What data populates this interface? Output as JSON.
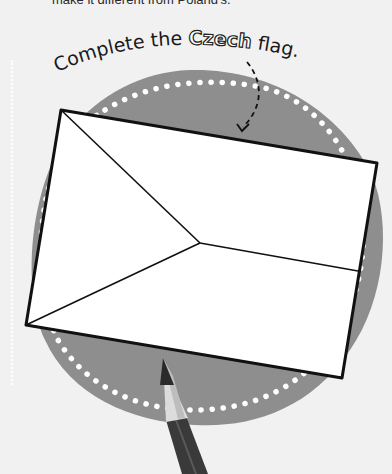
{
  "page": {
    "top_text": "make it different from Poland's.",
    "title_prefix": "Complete the ",
    "title_highlight": "Czech",
    "title_suffix": " flag."
  },
  "colors": {
    "background": "#f1f1f1",
    "blob": "#8e8e8e",
    "dots": "#ffffff",
    "flag_fill": "#ffffff",
    "outline": "#111111",
    "pencil_body": "#3a3a3a",
    "pencil_wood": "#d8d8d8",
    "pencil_lead": "#2a2a2a"
  },
  "flag": {
    "corners": {
      "top_left": [
        61,
        110
      ],
      "top_right": [
        377,
        163
      ],
      "bottom_right": [
        342,
        378
      ],
      "bottom_left": [
        26,
        325
      ]
    },
    "triangle_tip": [
      200,
      243
    ],
    "stripe_right_end": [
      358,
      271
    ]
  },
  "icons": {
    "arrow": "dashed-curved-arrow",
    "pencil": "pencil-icon"
  }
}
